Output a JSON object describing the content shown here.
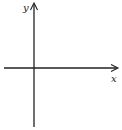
{
  "diagram": {
    "type": "cartesian-axes",
    "axes": {
      "x": {
        "label": "x",
        "direction": "right",
        "arrowhead": true
      },
      "y": {
        "label": "y",
        "direction": "up",
        "arrowhead": true
      }
    },
    "colors": {
      "line": "#222222",
      "background": "#ffffff"
    }
  }
}
